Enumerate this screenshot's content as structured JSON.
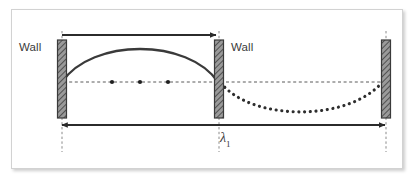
{
  "figure": {
    "type": "standing-wave-diagram",
    "title": "",
    "background_color": "#ffffff",
    "frame": {
      "border_color": "#d2d2d2",
      "shadow": true
    },
    "labels": {
      "wall_left": "Wall",
      "wall_middle": "Wall",
      "wavelength_symbol": "λ",
      "wavelength_subscript": "1"
    },
    "colors": {
      "wall_fill": "#8c8c8c",
      "wall_border": "#3a3a3a",
      "curve_solid": "#3a3a3a",
      "curve_dotted": "#2e2e2e",
      "axis_dash": "#5a5a5a",
      "arrow": "#2b2b2b",
      "guide_dash": "#8a8a8a",
      "text": "#3b3b3b"
    },
    "walls": [
      {
        "name": "wall-left",
        "x": 58,
        "y_top": 40,
        "y_bottom": 118,
        "width": 9
      },
      {
        "name": "wall-middle",
        "x": 218,
        "y_top": 40,
        "y_bottom": 118,
        "width": 9
      },
      {
        "name": "wall-right",
        "x": 382,
        "y_top": 40,
        "y_bottom": 118,
        "width": 9
      }
    ],
    "centerline": {
      "y": 82,
      "x_start": 58,
      "x_end": 391,
      "style": "dashed"
    },
    "nodes": [
      {
        "x": 112,
        "y": 82
      },
      {
        "x": 140,
        "y": 82
      },
      {
        "x": 168,
        "y": 82
      }
    ],
    "solid_wave": {
      "x_start": 62,
      "x_end": 218,
      "baseline_y": 82,
      "peak_y": 46,
      "style": "solid",
      "description": "first-harmonic antinode arc above axis"
    },
    "dotted_wave": {
      "x_start": 222,
      "x_end": 382,
      "baseline_y": 82,
      "trough_y": 110,
      "style": "dotted",
      "description": "continuation arc below axis"
    },
    "arrows": [
      {
        "name": "half-wavelength-arrow",
        "x_start": 62,
        "x_end": 218,
        "y": 35,
        "heads": "right",
        "label": ""
      },
      {
        "name": "full-wavelength-arrow",
        "x_start": 60,
        "x_end": 386,
        "y": 125,
        "heads": "both",
        "label": "λ1"
      }
    ],
    "guides": [
      {
        "name": "guide-left",
        "x": 62,
        "y_top": 31,
        "y_bottom": 152
      },
      {
        "name": "guide-middle",
        "x": 219,
        "y_top": 31,
        "y_bottom": 152
      },
      {
        "name": "guide-right",
        "x": 386,
        "y_top": 31,
        "y_bottom": 152
      }
    ]
  }
}
